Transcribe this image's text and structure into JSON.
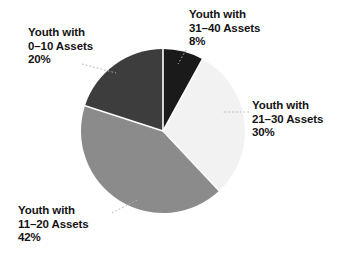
{
  "chart_data": {
    "type": "pie",
    "title": "",
    "subtitle": "",
    "xlabel": "",
    "ylabel": "",
    "legend_position": "none",
    "grid": false,
    "start_angle_deg": 0,
    "direction": "clockwise",
    "categories": [
      "Youth with 31–40 Assets",
      "Youth with 21–30 Assets",
      "Youth with 11–20 Assets",
      "Youth with 0–10 Assets"
    ],
    "values": [
      8,
      30,
      42,
      20
    ],
    "value_labels": [
      "8%",
      "30%",
      "42%",
      "20%"
    ],
    "colors": [
      "#1a1a1a",
      "#f2f2f2",
      "#8b8b8b",
      "#3d3d3d"
    ],
    "slices": [
      {
        "id": "slice-31-40",
        "name_line1": "Youth with",
        "name_line2": "31–40 Assets",
        "value": 8,
        "value_label": "8%",
        "color": "#1a1a1a"
      },
      {
        "id": "slice-21-30",
        "name_line1": "Youth with",
        "name_line2": "21–30 Assets",
        "value": 30,
        "value_label": "30%",
        "color": "#f2f2f2"
      },
      {
        "id": "slice-11-20",
        "name_line1": "Youth with",
        "name_line2": "11–20 Assets",
        "value": 42,
        "value_label": "42%",
        "color": "#8b8b8b"
      },
      {
        "id": "slice-0-10",
        "name_line1": "Youth with",
        "name_line2": "0–10 Assets",
        "value": 20,
        "value_label": "20%",
        "color": "#3d3d3d"
      }
    ]
  },
  "labels": {
    "top": {
      "line1": "Youth with",
      "line2": "31–40 Assets",
      "line3": "8%"
    },
    "top_left": {
      "line1": "Youth with",
      "line2": "0–10 Assets",
      "line3": "20%"
    },
    "right": {
      "line1": "Youth with",
      "line2": "21–30 Assets",
      "line3": "30%"
    },
    "bottom_left": {
      "line1": "Youth with",
      "line2": "11–20 Assets",
      "line3": "42%"
    }
  },
  "style": {
    "background": "#ffffff",
    "text_color": "#141414",
    "leader_line_color": "#b4b4b4",
    "slice_separator_color": "#ffffff"
  }
}
